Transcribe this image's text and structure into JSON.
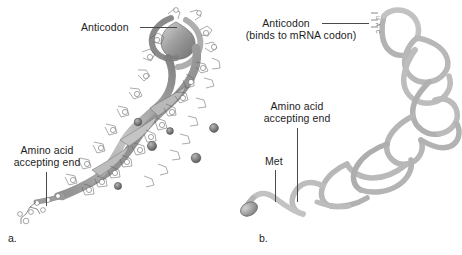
{
  "figure": {
    "panels": [
      {
        "id": "a",
        "panel_label": "a.",
        "caption_style": "three-dimensional ribbon model of tRNA",
        "labels": [
          {
            "name": "anticodon",
            "text": "Anticodon"
          },
          {
            "name": "amino-acid-accepting-end",
            "line1": "Amino acid",
            "line2": "accepting end"
          }
        ]
      },
      {
        "id": "b",
        "panel_label": "b.",
        "caption_style": "simplified backbone tube model of tRNA",
        "labels": [
          {
            "name": "anticodon",
            "line1": "Anticodon",
            "line2": "(binds to mRNA codon)"
          },
          {
            "name": "amino-acid-accepting-end",
            "line1": "Amino acid",
            "line2": "accepting end"
          },
          {
            "name": "met",
            "text": "Met"
          }
        ],
        "anticodon_bases": "UAC"
      }
    ],
    "colors": {
      "background": "#ffffff",
      "text": "#1d1d1d",
      "leader_line": "#4a4a4a",
      "ribbon_light": "#c9c9c9",
      "ribbon_mid": "#9a9a9a",
      "ribbon_dark": "#6e6e6e",
      "tube_light": "#d8d8d8",
      "tube_mid": "#a8a8a8",
      "tube_dark": "#7a7a7a",
      "sphere": "#8c8c8c"
    }
  }
}
